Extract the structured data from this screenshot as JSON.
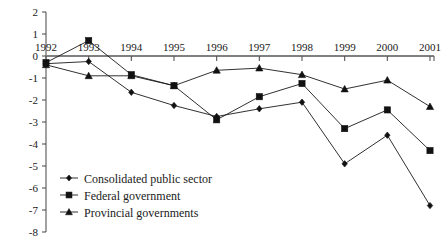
{
  "chart_data": {
    "type": "line",
    "title": "",
    "subtitle": "",
    "xlabel": "",
    "ylabel": "",
    "categories": [
      "1992",
      "1993",
      "1994",
      "1995",
      "1996",
      "1997",
      "1998",
      "1999",
      "2000",
      "2001"
    ],
    "x": [
      1992,
      1993,
      1994,
      1995,
      1996,
      1997,
      1998,
      1999,
      2000,
      2001
    ],
    "xlim": [
      1992,
      2001
    ],
    "ylim": [
      -8,
      2
    ],
    "yticks": [
      2,
      1,
      0,
      -1,
      -2,
      -3,
      -4,
      -5,
      -6,
      -7,
      -8
    ],
    "ytick_labels": [
      "2",
      "1",
      "0",
      "-1",
      "-2",
      "-3",
      "-4",
      "-5",
      "-6",
      "-7",
      "-8"
    ],
    "grid": false,
    "legend_position": "lower-left",
    "zero_line": 0,
    "series": [
      {
        "name": "Consolidated public sector",
        "marker": "diamond",
        "values": [
          -0.35,
          -0.25,
          -1.65,
          -2.25,
          -2.75,
          -2.4,
          -2.1,
          -4.9,
          -3.6,
          -6.8
        ]
      },
      {
        "name": "Federal government",
        "marker": "square",
        "values": [
          -0.3,
          0.7,
          -0.85,
          -1.35,
          -2.9,
          -1.85,
          -1.25,
          -3.3,
          -2.45,
          -4.3
        ]
      },
      {
        "name": "Provincial governments",
        "marker": "triangle",
        "values": [
          -0.4,
          -0.9,
          -0.9,
          -1.35,
          -0.65,
          -0.55,
          -0.85,
          -1.5,
          -1.1,
          -2.3
        ]
      }
    ]
  },
  "legend": {
    "items": [
      {
        "label": "Consolidated public sector",
        "marker": "diamond"
      },
      {
        "label": "Federal government",
        "marker": "square"
      },
      {
        "label": "Provincial governments",
        "marker": "triangle"
      }
    ]
  },
  "colors": {
    "ink": "#1a1a1a",
    "axis": "#555555",
    "zero_axis": "#808080",
    "background": "#ffffff"
  }
}
